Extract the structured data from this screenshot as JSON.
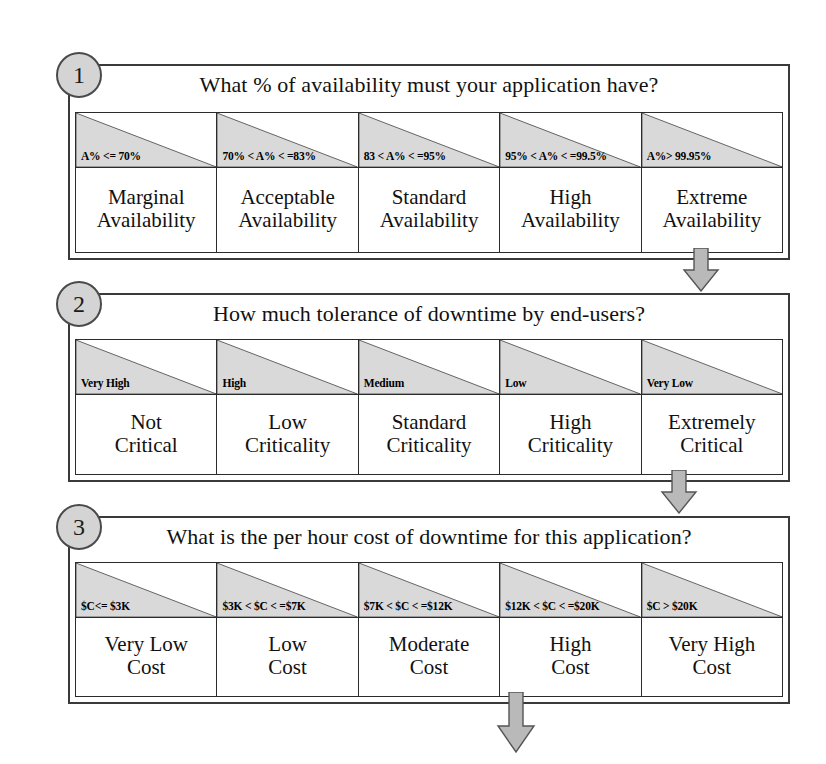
{
  "diagram": {
    "background_color": "#ffffff",
    "shade_color": "#d9d9d9",
    "line_color": "#2b2b2b",
    "badge_fill": "#d4d4d4"
  },
  "sections": [
    {
      "number": "1",
      "question": "What % of availability must your application have?",
      "columns": [
        {
          "range": "A% <= 70%",
          "category": "Marginal\nAvailability"
        },
        {
          "range": "70% < A% < =83%",
          "category": "Acceptable\nAvailability"
        },
        {
          "range": "83 < A% < =95%",
          "category": "Standard\nAvailability"
        },
        {
          "range": "95% < A% < =99.5%",
          "category": "High\nAvailability"
        },
        {
          "range": "A%> 99.95%",
          "category": "Extreme\nAvailability"
        }
      ]
    },
    {
      "number": "2",
      "question": "How much tolerance of downtime by end-users?",
      "columns": [
        {
          "range": "Very High",
          "category": "Not\nCritical"
        },
        {
          "range": "High",
          "category": "Low\nCriticality"
        },
        {
          "range": "Medium",
          "category": "Standard\nCriticality"
        },
        {
          "range": "Low",
          "category": "High\nCriticality"
        },
        {
          "range": "Very Low",
          "category": "Extremely\nCritical"
        }
      ]
    },
    {
      "number": "3",
      "question": "What is the per hour cost of downtime  for this application?",
      "columns": [
        {
          "range": "$C<= $3K",
          "category": "Very Low\nCost"
        },
        {
          "range": "$3K < $C < =$7K",
          "category": "Low\nCost"
        },
        {
          "range": "$7K < $C < =$12K",
          "category": "Moderate\nCost"
        },
        {
          "range": "$12K < $C < =$20K",
          "category": "High\nCost"
        },
        {
          "range": "$C > $20K",
          "category": "Very High\nCost"
        }
      ]
    }
  ],
  "arrows": [
    {
      "name": "arrow-section1-to-section2"
    },
    {
      "name": "arrow-section2-to-section3"
    },
    {
      "name": "arrow-section3-output"
    }
  ]
}
